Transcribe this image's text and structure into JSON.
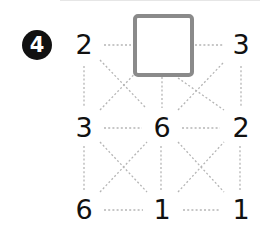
{
  "problem": {
    "number_label": "4",
    "grid": [
      [
        "2",
        "",
        "3"
      ],
      [
        "3",
        "6",
        "2"
      ],
      [
        "6",
        "1",
        "1"
      ]
    ],
    "blank_cell": {
      "row": 0,
      "col": 1
    }
  },
  "colors": {
    "text": "#111111",
    "box_border": "#8a8a8a",
    "dotted_line": "#b5b5b5"
  }
}
